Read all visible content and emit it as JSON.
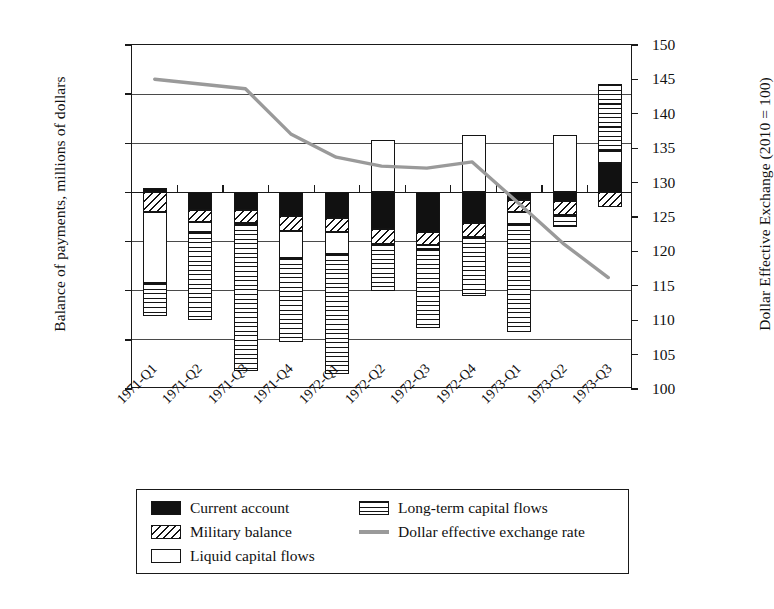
{
  "axes": {
    "y_left_title": "Balance of payments, millions of dollars",
    "y_right_title": "Dollar Effective Exchange (2010 = 100)",
    "y_left_ticks": [
      "6000",
      "4000",
      "2000",
      "0",
      "-2000",
      "-4000",
      "-6000",
      "-8000"
    ],
    "y_right_ticks": [
      "150",
      "145",
      "140",
      "135",
      "130",
      "125",
      "120",
      "115",
      "110",
      "105",
      "100"
    ]
  },
  "legend": {
    "items": [
      {
        "label": "Current account",
        "key": "black"
      },
      {
        "label": "Military balance",
        "key": "dhatch"
      },
      {
        "label": "Liquid capital flows",
        "key": "white"
      },
      {
        "label": "Long-term capital flows",
        "key": "hlines"
      },
      {
        "label": "Dollar effective exchange rate",
        "key": "line"
      }
    ]
  },
  "caption": "",
  "colors": {
    "current_account": "#111111",
    "military_balance": "#ffffff",
    "liquid_capital": "#ffffff",
    "long_term_capital": "#ffffff",
    "fx_line": "#9a9a9a",
    "axis": "#1a1a1a",
    "grid": "#4a4a4a"
  },
  "chart_data": {
    "type": "bar",
    "title": "",
    "xlabel": "",
    "ylabel": "Balance of payments, millions of dollars",
    "y2label": "Dollar Effective Exchange (2010 = 100)",
    "ylim": [
      -8000,
      6000
    ],
    "y2lim": [
      100,
      150
    ],
    "grid": true,
    "legend_position": "bottom",
    "stacked": true,
    "categories": [
      "1971-Q1",
      "1971-Q2",
      "1971-Q3",
      "1971-Q4",
      "1972-Q1",
      "1972-Q2",
      "1972-Q3",
      "1972-Q4",
      "1973-Q1",
      "1973-Q2",
      "1973-Q3"
    ],
    "series": [
      {
        "name": "Current account",
        "pattern": "solid-black",
        "values": [
          200,
          -700,
          -700,
          -950,
          -1050,
          -1500,
          -1600,
          -1250,
          -300,
          -350,
          1200
        ]
      },
      {
        "name": "Military balance",
        "pattern": "diagonal-hatch",
        "values": [
          -800,
          -500,
          -550,
          -600,
          -550,
          -600,
          -550,
          -550,
          -500,
          -550,
          -600
        ]
      },
      {
        "name": "Liquid capital flows",
        "pattern": "white",
        "values": [
          -2900,
          -400,
          -50,
          -1100,
          -900,
          2150,
          -150,
          2350,
          -500,
          2350,
          500
        ]
      },
      {
        "name": "Long-term capital flows",
        "pattern": "horizontal-lines",
        "values": [
          -1350,
          -3600,
          -5950,
          -3450,
          -4900,
          -1900,
          -3200,
          -2400,
          -4400,
          -500,
          2700
        ]
      }
    ],
    "fx_line": {
      "name": "Dollar effective exchange rate",
      "axis": "right",
      "values": [
        145.0,
        144.3,
        143.6,
        137.0,
        133.6,
        132.3,
        132.0,
        132.9,
        127.0,
        121.0,
        116.0
      ]
    }
  }
}
